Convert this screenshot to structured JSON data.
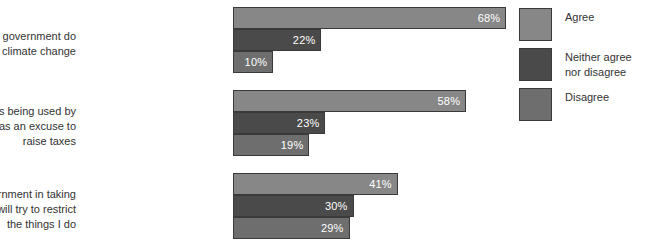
{
  "chart_data": {
    "type": "bar",
    "orientation": "horizontal",
    "title": "",
    "xlabel": "",
    "ylabel": "",
    "xlim": [
      0,
      100
    ],
    "grid": false,
    "legend_position": "right",
    "value_suffix": "%",
    "categories": [
      "I want to see the government do\nmore on climate change",
      "Climate change is being used by\nthe government as an excuse to\nraise taxes",
      "I am worried the government in taking\naction will try to restrict\nthe things I do"
    ],
    "series": [
      {
        "name": "Agree",
        "color": "#878787",
        "values": [
          68,
          58,
          41
        ],
        "labels": [
          "68%",
          "58%",
          "41%"
        ]
      },
      {
        "name": "Neither agree\nnor disagree",
        "color": "#4a4a4a",
        "values": [
          22,
          23,
          30
        ],
        "labels": [
          "22%",
          "23%",
          "30%"
        ]
      },
      {
        "name": "Disagree",
        "color": "#6e6e6e",
        "values": [
          10,
          19,
          29
        ],
        "labels": [
          "10%",
          "19%",
          "29%"
        ]
      }
    ]
  },
  "legend": {
    "items": [
      {
        "label": "Agree",
        "color": "#878787"
      },
      {
        "label": "Neither agree\nnor disagree",
        "color": "#4a4a4a"
      },
      {
        "label": "Disagree",
        "color": "#6e6e6e"
      }
    ]
  }
}
